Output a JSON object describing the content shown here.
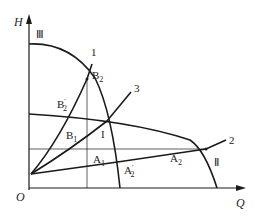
{
  "diagram": {
    "axes": {
      "y_label": "H",
      "x_label": "Q",
      "origin_label": "O"
    },
    "curves": {
      "curve_III": "Ⅲ",
      "curve_II": "Ⅱ",
      "curve_1": "1",
      "curve_2": "2",
      "curve_3": "3"
    },
    "points": {
      "B2": {
        "base": "B",
        "sub": "2"
      },
      "B2_prime": {
        "base": "B",
        "sub": "2",
        "prime": "′"
      },
      "B1": {
        "base": "B",
        "sub": "1"
      },
      "I": {
        "base": "I"
      },
      "A1": {
        "base": "A",
        "sub": "1"
      },
      "A2": {
        "base": "A",
        "sub": "2"
      },
      "A2_prime": {
        "base": "A",
        "sub": "2",
        "prime": "′"
      }
    },
    "colors": {
      "line": "#1a1a1a",
      "background": "#ffffff"
    }
  }
}
